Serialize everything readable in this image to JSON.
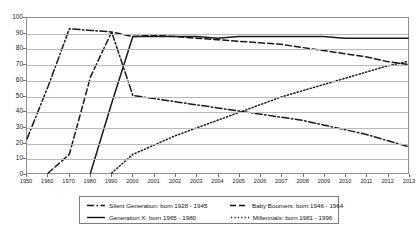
{
  "chart_data": {
    "type": "line",
    "title": "",
    "xlabel": "",
    "ylabel": "",
    "ylim": [
      0,
      100
    ],
    "ytick_step": 10,
    "grid": true,
    "legend_position": "bottom",
    "yticks": [
      "0",
      "10",
      "20",
      "30",
      "40",
      "50",
      "60",
      "70",
      "80",
      "90",
      "100"
    ],
    "categories": [
      "1950",
      "1960",
      "1970",
      "1980",
      "1990",
      "2000",
      "2001",
      "2002",
      "2003",
      "2004",
      "2005",
      "2006",
      "2007",
      "2008",
      "2009",
      "2010",
      "2011",
      "2012",
      "2013"
    ],
    "series": [
      {
        "name": "Silent Generation: born 1928 - 1945",
        "dash": "dash-dot",
        "color": "#1a1a1a",
        "values": [
          22,
          56,
          93,
          92,
          91,
          50,
          48,
          46,
          44,
          42,
          40,
          38,
          36,
          34,
          31,
          28,
          25,
          21,
          17
        ]
      },
      {
        "name": "Baby Boomers: born 1946 - 1964",
        "dash": "dashed",
        "color": "#1a1a1a",
        "values": [
          0,
          0,
          12,
          62,
          91,
          88,
          89,
          88,
          87,
          86,
          85,
          84,
          83,
          81,
          79,
          77,
          75,
          72,
          70
        ]
      },
      {
        "name": "Generation X: born 1965 - 1980",
        "dash": "solid",
        "color": "#1a1a1a",
        "values": [
          0,
          0,
          0,
          0,
          45,
          88,
          88,
          88,
          88,
          87,
          88,
          88,
          88,
          88,
          88,
          87,
          87,
          87,
          87
        ]
      },
      {
        "name": "Millennials: born 1981 - 1996",
        "dash": "dotted",
        "color": "#1a1a1a",
        "values": [
          0,
          0,
          0,
          0,
          0,
          12,
          18,
          24,
          29,
          34,
          39,
          44,
          49,
          53,
          57,
          61,
          65,
          69,
          72
        ]
      }
    ]
  },
  "legend": {
    "items": [
      {
        "label": "Silent Generation: born 1928 - 1945",
        "dash": "dash-dot"
      },
      {
        "label": "Baby Boomers: born 1946 - 1964",
        "dash": "dashed"
      },
      {
        "label": "Generation X: born 1965 - 1980",
        "dash": "solid"
      },
      {
        "label": "Millennials: born 1981 - 1996",
        "dash": "dotted"
      }
    ]
  }
}
